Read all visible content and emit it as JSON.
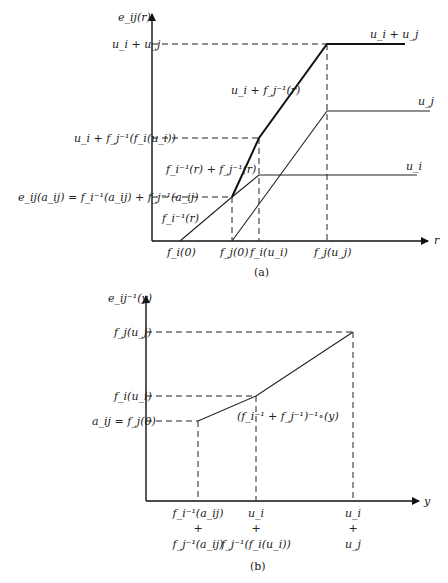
{
  "panel_a": {
    "caption": "(a)",
    "y_axis_label": "e_ij(r)",
    "x_axis_label": "r",
    "y_ticks": {
      "ui_plus_uj": "u_i + u_j",
      "ui_plus_fj_inv_fi_ui": "u_i + f_j⁻¹(f_i(u_i))",
      "eij_aij": "e_ij(a_ij) = f_i⁻¹(a_ij) + f_j⁻¹(a_ij)"
    },
    "x_ticks": [
      "f_i(0)",
      "f_j(0)",
      "f_i(u_i)",
      "f_j(u_j)"
    ],
    "curve_labels": {
      "ui_plus_uj": "u_i + u_j",
      "uj": "u_j",
      "ui": "u_i",
      "ui_plus_fj_inv_r": "u_i + f_j⁻¹(r)",
      "fi_inv_plus_fj_inv": "f_i⁻¹(r) + f_j⁻¹(r)",
      "fi_inv_r": "f_i⁻¹(r)"
    }
  },
  "panel_b": {
    "caption": "(b)",
    "y_axis_label": "e_ij⁻¹(y)",
    "x_axis_label": "y",
    "y_ticks": {
      "fj_uj": "f_j(u_j)",
      "fi_ui": "f_i(u_i)",
      "aij": "a_ij = f_j(0)"
    },
    "x_ticks": [
      {
        "top": "f_i⁻¹(a_ij)",
        "mid": "+",
        "bottom": "f_j⁻¹(a_ij)"
      },
      {
        "top": "u_i",
        "mid": "+",
        "bottom": "f_j⁻¹(f_i(u_i))"
      },
      {
        "top": "u_i",
        "mid": "+",
        "bottom": "u_j"
      }
    ],
    "curve_label": "(f_i⁻¹ + f_j⁻¹)⁻¹∘(y)"
  }
}
